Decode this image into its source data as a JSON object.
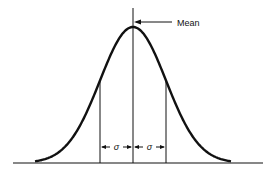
{
  "diagram": {
    "mean_label": "Mean",
    "sigma_left_label": "σ",
    "sigma_right_label": "σ",
    "stroke_color": "#111111",
    "background": "#ffffff"
  }
}
